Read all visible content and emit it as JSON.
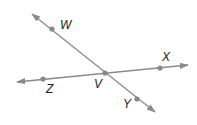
{
  "diagram": {
    "type": "intersecting-lines",
    "colors": {
      "line": "#8a8a8a",
      "point": "#888888",
      "label": "#1a1a1a",
      "background": "#ffffff"
    },
    "lines": [
      {
        "name": "line-WY",
        "through": [
          "W",
          "V",
          "Y"
        ],
        "x1": 32,
        "y1": 14,
        "x2": 155,
        "y2": 112
      },
      {
        "name": "line-ZX",
        "through": [
          "Z",
          "V",
          "X"
        ],
        "x1": 17,
        "y1": 82,
        "x2": 188,
        "y2": 65
      }
    ],
    "points": [
      {
        "id": "W",
        "label": "W",
        "x": 52,
        "y": 29,
        "lx": 60,
        "ly": 29
      },
      {
        "id": "X",
        "label": "X",
        "x": 160,
        "y": 68,
        "lx": 162,
        "ly": 61
      },
      {
        "id": "V",
        "label": "V",
        "x": 105,
        "y": 73,
        "lx": 94,
        "ly": 88
      },
      {
        "id": "Z",
        "label": "Z",
        "x": 43,
        "y": 79,
        "lx": 46,
        "ly": 93
      },
      {
        "id": "Y",
        "label": "Y",
        "x": 137,
        "y": 99,
        "lx": 123,
        "ly": 108
      }
    ]
  }
}
